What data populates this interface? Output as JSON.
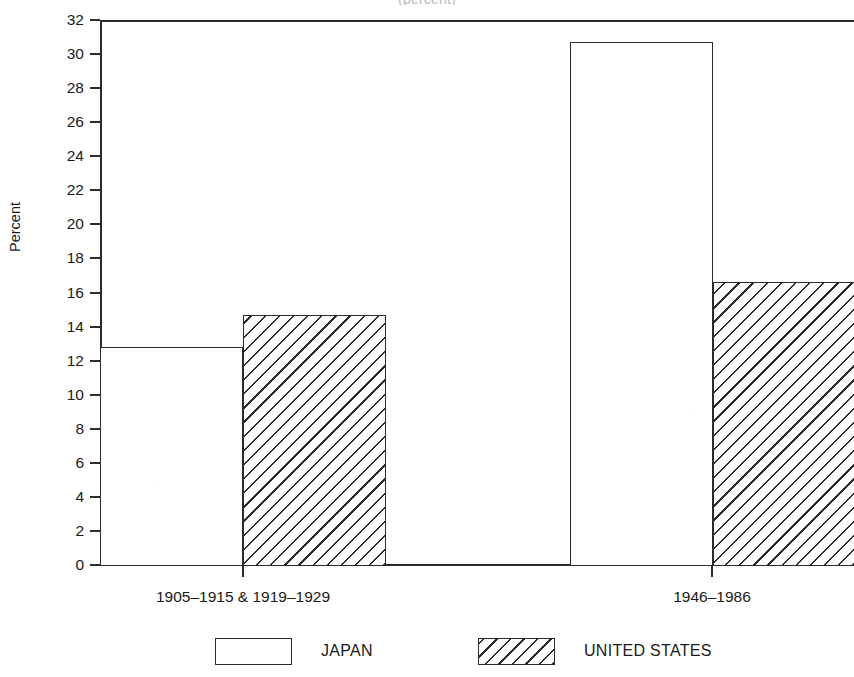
{
  "chart_data": {
    "type": "bar",
    "title": "",
    "subtitle": "(percent)",
    "xlabel": "",
    "ylabel": "Percent",
    "ylim": [
      0,
      32
    ],
    "ytick_step": 2,
    "yticks": [
      32,
      30,
      28,
      26,
      24,
      22,
      20,
      18,
      16,
      14,
      12,
      10,
      8,
      6,
      4,
      2,
      0
    ],
    "grid": false,
    "legend_position": "bottom",
    "categories": [
      "1905–1915 & 1919–1929",
      "1946–1986"
    ],
    "series": [
      {
        "name": "JAPAN",
        "style": "open",
        "values": [
          12.8,
          30.7
        ]
      },
      {
        "name": "UNITED STATES",
        "style": "hatched",
        "values": [
          14.7,
          16.6
        ]
      }
    ]
  },
  "axes": {
    "y_title": "Percent",
    "tick_labels": [
      "32",
      "30",
      "28",
      "26",
      "24",
      "22",
      "20",
      "18",
      "16",
      "14",
      "12",
      "10",
      "8",
      "6",
      "4",
      "2",
      "0"
    ],
    "category_labels": [
      "1905–1915 & 1919–1929",
      "1946–1986"
    ]
  },
  "legend": {
    "items": [
      {
        "label": "JAPAN",
        "swatch": "open-rectangle-swatch"
      },
      {
        "label": "UNITED STATES",
        "swatch": "hatched-rectangle-swatch"
      }
    ]
  },
  "colors": {
    "ink": "#2b2b2b",
    "paper": "#ffffff",
    "text": "#1a1a1a"
  }
}
